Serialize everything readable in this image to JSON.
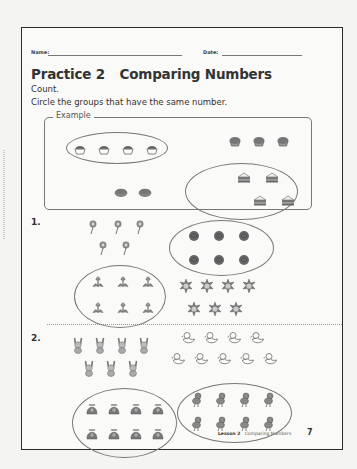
{
  "header": {
    "name_label": "Name:",
    "date_label": "Date:"
  },
  "title": "Practice 2",
  "subtitle": "Comparing Numbers",
  "instructions": [
    "Count.",
    "Circle the groups that have the same number."
  ],
  "example": {
    "label": "Example",
    "groups": [
      {
        "item": "cupcake",
        "count": 4,
        "circled": true
      },
      {
        "item": "muffin",
        "count": 3,
        "circled": false
      },
      {
        "item": "pie",
        "count": 2,
        "circled": false
      },
      {
        "item": "sandwich",
        "count": 4,
        "circled": true
      }
    ]
  },
  "problems": [
    {
      "number": "1.",
      "groups": [
        {
          "item": "small-flower",
          "count": 5,
          "circled": false
        },
        {
          "item": "rose",
          "count": 6,
          "circled": true
        },
        {
          "item": "tulip",
          "count": 6,
          "circled": true
        },
        {
          "item": "sunflower",
          "count": 7,
          "circled": false
        }
      ]
    },
    {
      "number": "2.",
      "groups": [
        {
          "item": "bunny",
          "count": 7,
          "circled": false
        },
        {
          "item": "duck",
          "count": 9,
          "circled": false
        },
        {
          "item": "hedgehog",
          "count": 8,
          "circled": true
        },
        {
          "item": "chick",
          "count": 8,
          "circled": true
        }
      ]
    }
  ],
  "footer": {
    "lesson": "Lesson 2",
    "topic": "Comparing Numbers",
    "page_number": "7"
  }
}
